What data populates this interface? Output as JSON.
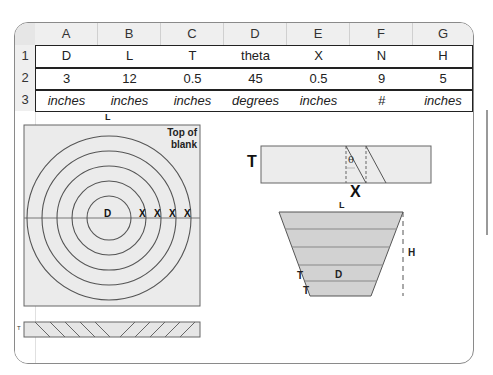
{
  "spreadsheet": {
    "columns": [
      "A",
      "B",
      "C",
      "D",
      "E",
      "F",
      "G"
    ],
    "rows": [
      {
        "num": "1",
        "cells": [
          "D",
          "L",
          "T",
          "theta",
          "X",
          "N",
          "H"
        ],
        "italic": false
      },
      {
        "num": "2",
        "cells": [
          "3",
          "12",
          "0.5",
          "45",
          "0.5",
          "9",
          "5"
        ],
        "italic": false
      },
      {
        "num": "3",
        "cells": [
          "inches",
          "inches",
          "inches",
          "degrees",
          "inches",
          "#",
          "inches"
        ],
        "italic": true
      }
    ]
  },
  "diagrams": {
    "top_view": {
      "label_L": "L",
      "label_top": "Top of",
      "label_blank": "blank",
      "label_D": "D",
      "label_X": "X",
      "ring_count": 5
    },
    "side_strip": {
      "label_T": "T"
    },
    "cross_section": {
      "label_T": "T",
      "label_theta": "θ",
      "label_X": "X"
    },
    "bowl_profile": {
      "label_L": "L",
      "label_H": "H",
      "label_D": "D",
      "label_T1": "T",
      "label_T2": "T"
    }
  }
}
